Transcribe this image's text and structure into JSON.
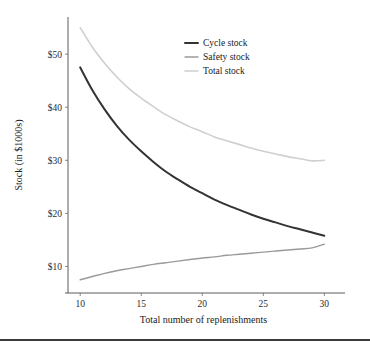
{
  "chart_data": {
    "type": "line",
    "title": "",
    "xlabel": "Total number of replenishments",
    "ylabel": "Stock (in $1000s)",
    "xlim": [
      9.0,
      31.2
    ],
    "ylim": [
      5.0,
      57.0
    ],
    "grid": false,
    "legend_position": "top-center-right",
    "x_ticks": [
      10,
      15,
      20,
      25,
      30
    ],
    "x_tick_labels": [
      "10",
      "15",
      "20",
      "25",
      "30"
    ],
    "y_ticks": [
      10,
      20,
      30,
      40,
      50
    ],
    "y_tick_labels": [
      "$10",
      "$20",
      "$30",
      "$40",
      "$50"
    ],
    "x": [
      10,
      11,
      12,
      13,
      14,
      15,
      16,
      17,
      18,
      19,
      20,
      21,
      22,
      23,
      24,
      25,
      26,
      27,
      28,
      29,
      30
    ],
    "series": [
      {
        "name": "Cycle stock",
        "color": "#333333",
        "width": 2.0,
        "values": [
          47.5,
          43.2,
          39.6,
          36.5,
          33.9,
          31.7,
          29.7,
          27.9,
          26.4,
          25.0,
          23.8,
          22.6,
          21.6,
          20.7,
          19.8,
          19.0,
          18.3,
          17.6,
          17.0,
          16.4,
          15.8
        ]
      },
      {
        "name": "Safety stock",
        "color": "#9a9a9a",
        "width": 1.4,
        "values": [
          7.5,
          8.1,
          8.7,
          9.2,
          9.6,
          10.0,
          10.4,
          10.7,
          11.0,
          11.3,
          11.6,
          11.8,
          12.1,
          12.3,
          12.5,
          12.7,
          12.9,
          13.1,
          13.3,
          13.5,
          14.2
        ]
      },
      {
        "name": "Total stock",
        "color": "#cfcfcf",
        "width": 1.6,
        "values": [
          55.0,
          51.3,
          48.3,
          45.7,
          43.5,
          41.7,
          40.1,
          38.6,
          37.4,
          36.3,
          35.4,
          34.4,
          33.7,
          33.0,
          32.3,
          31.7,
          31.2,
          30.7,
          30.3,
          29.9,
          30.0
        ]
      }
    ]
  },
  "legend": {
    "entries": [
      {
        "label": "Cycle stock"
      },
      {
        "label": "Safety stock"
      },
      {
        "label": "Total stock"
      }
    ]
  }
}
